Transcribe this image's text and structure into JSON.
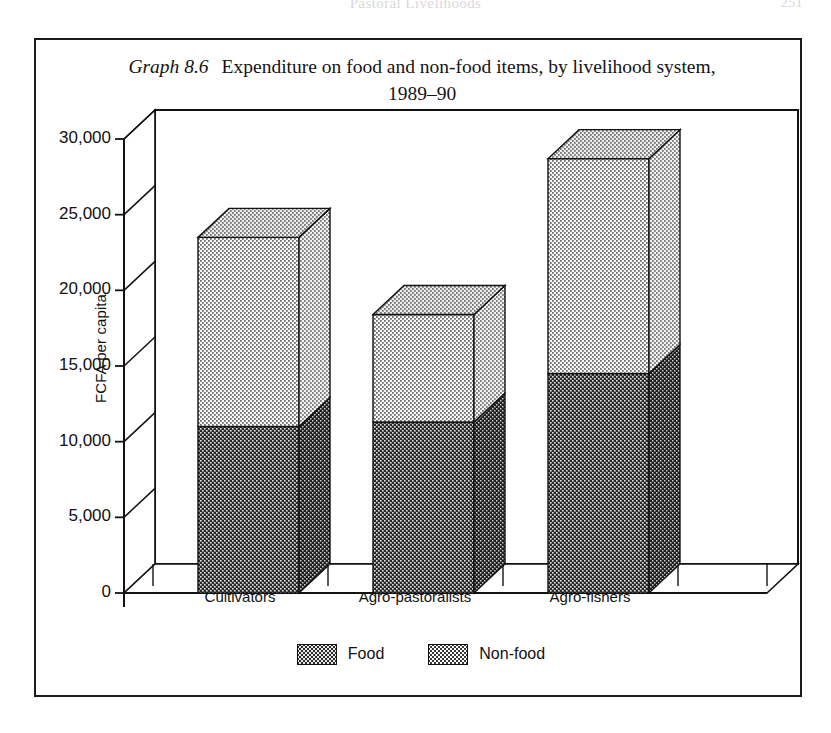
{
  "running_head": {
    "text": "Pastoral Livelihoods",
    "page_number": "251"
  },
  "caption": {
    "label": "Graph 8.6",
    "title": "Expenditure on food and non-food items, by livelihood system,",
    "title_line2": "1989–90"
  },
  "chart_data": {
    "type": "bar",
    "stacked": true,
    "three_d": true,
    "title": "Expenditure on food and non-food items, by livelihood system, 1989–90",
    "xlabel": "",
    "ylabel": "FCFA per capita",
    "categories": [
      "Cultivators",
      "Agro-pastoralists",
      "Agro-fishers"
    ],
    "series": [
      {
        "name": "Food",
        "values": [
          11000,
          11300,
          14500
        ]
      },
      {
        "name": "Non-food",
        "values": [
          12500,
          7100,
          14200
        ]
      }
    ],
    "totals": [
      23500,
      18400,
      28700
    ],
    "ylim": [
      0,
      30000
    ],
    "ytick_values": [
      0,
      5000,
      10000,
      15000,
      20000,
      25000,
      30000
    ],
    "ytick_labels": [
      "0",
      "5,000",
      "10,000",
      "15,000",
      "20,000",
      "25,000",
      "30,000"
    ],
    "grid": false,
    "legend_position": "bottom",
    "colors": {
      "food": "#2a2a2a",
      "nonfood": "#fbfbfb",
      "axis": "#111111"
    }
  },
  "legend": {
    "items": [
      {
        "key": "food",
        "label": "Food"
      },
      {
        "key": "nonfood",
        "label": "Non-food"
      }
    ]
  }
}
